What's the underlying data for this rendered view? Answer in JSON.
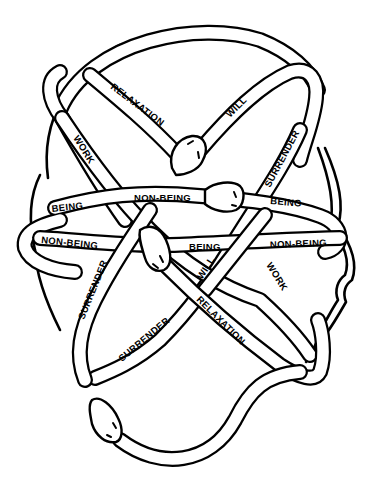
{
  "diagram": {
    "title": "",
    "colors": {
      "ink": "#000000",
      "paper": "#ffffff"
    },
    "labels": {
      "relaxation_top": "RELAXATION",
      "will_top": "WILL",
      "work_left": "WORK",
      "surrender_right": "SURRENDER",
      "being_left": "BEING",
      "non_being_center": "NON-BEING",
      "being_right": "BEING",
      "non_being_left": "NON-BEING",
      "being_center": "BEING",
      "non_being_right": "NON-BEING",
      "surrender_left": "SURRENDER",
      "will_bottom": "WILL",
      "work_right": "WORK",
      "surrender_bottom": "SURRENDER",
      "relaxation_bottom": "RELAXATION"
    },
    "snake_heads": [
      "snake-head-top-center",
      "snake-head-center-right",
      "snake-head-center-left",
      "snake-head-bottom-left"
    ]
  }
}
